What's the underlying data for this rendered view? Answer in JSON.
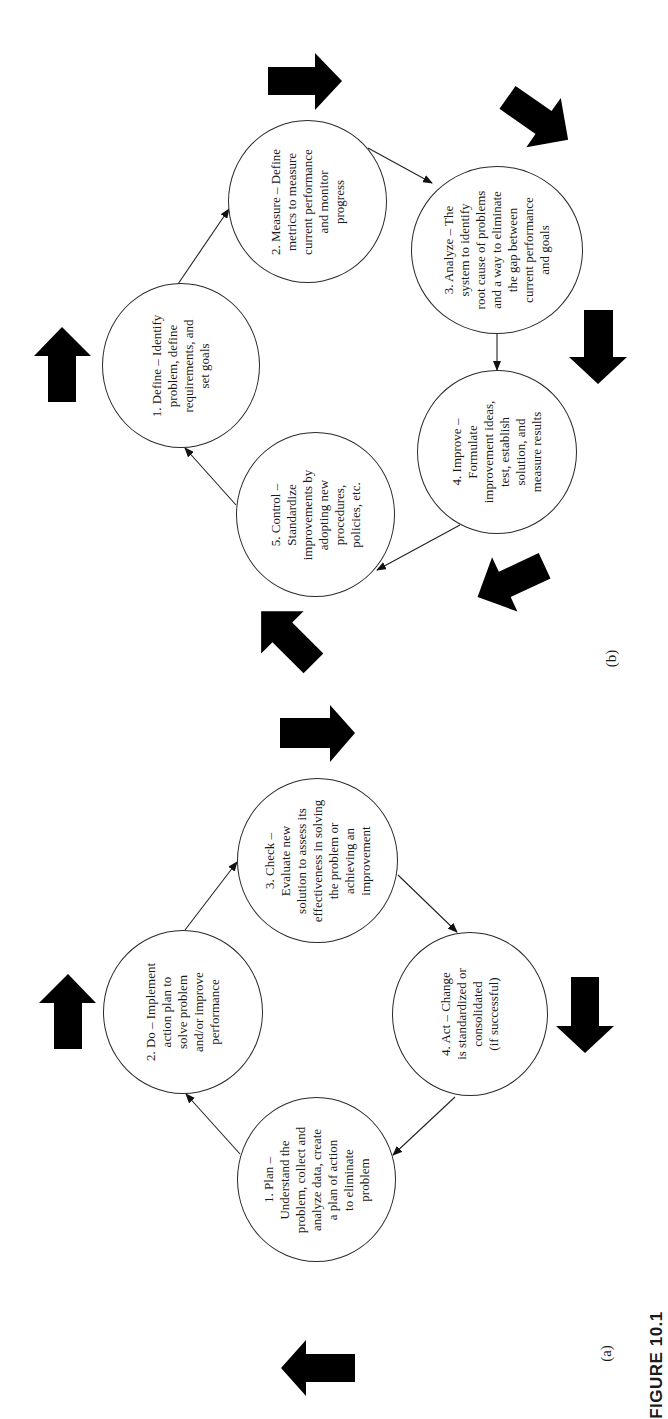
{
  "figure": {
    "caption": "FIGURE 10.1",
    "orientation": "page rotated 90° counter-clockwise"
  },
  "panels": [
    {
      "id": "a",
      "label": "(a)",
      "cycle": "PDCA",
      "nodes": [
        {
          "id": "plan",
          "text": "1. Plan –\nUnderstand the\nproblem, collect and\nanalyze data, create\na plan of action\nto eliminate\nproblem"
        },
        {
          "id": "do",
          "text": "2. Do – Implement\naction plan to\nsolve problem\nand/or improve\nperformance"
        },
        {
          "id": "check",
          "text": "3. Check –\nEvaluate new\nsolution to assess its\neffectiveness in solving\nthe problem or\nachieving an\nimprovement"
        },
        {
          "id": "act",
          "text": "4. Act – Change\nis standardized or\nconsolidated\n(if successful)"
        }
      ],
      "edges": [
        {
          "from": "plan",
          "to": "do"
        },
        {
          "from": "do",
          "to": "check"
        },
        {
          "from": "check",
          "to": "act"
        },
        {
          "from": "act",
          "to": "plan"
        }
      ],
      "block_arrows": [
        "up-icon",
        "right-icon",
        "down-icon",
        "left-icon"
      ]
    },
    {
      "id": "b",
      "label": "(b)",
      "cycle": "DMAIC",
      "nodes": [
        {
          "id": "define",
          "text": "1. Define – Identify\nproblem, define\nrequirements, and\nset goals"
        },
        {
          "id": "measure",
          "text": "2. Measure – Define\nmetrics to measure\ncurrent performance\nand monitor\nprogress"
        },
        {
          "id": "analyze",
          "text": "3. Analyze – The\nsystem to identify\nroot cause of problems\nand a way to eliminate\nthe gap between\ncurrent performance\nand goals"
        },
        {
          "id": "improve",
          "text": "4. Improve –\nFormulate\nimprovement ideas,\ntest, establish\nsolution, and\nmeasure results"
        },
        {
          "id": "control",
          "text": "5. Control –\nStandardize\nimprovements by\nadopting new\nprocedures,\npolicies, etc."
        }
      ],
      "edges": [
        {
          "from": "define",
          "to": "measure"
        },
        {
          "from": "measure",
          "to": "analyze"
        },
        {
          "from": "analyze",
          "to": "improve"
        },
        {
          "from": "improve",
          "to": "control"
        },
        {
          "from": "control",
          "to": "define"
        }
      ],
      "block_arrows": [
        "up-icon",
        "right-icon",
        "down-right-icon",
        "down-icon",
        "down-left-icon",
        "up-left-icon"
      ]
    }
  ],
  "colors": {
    "ink": "#1a1a1a",
    "block_arrow": "#000000",
    "background": "#ffffff"
  }
}
